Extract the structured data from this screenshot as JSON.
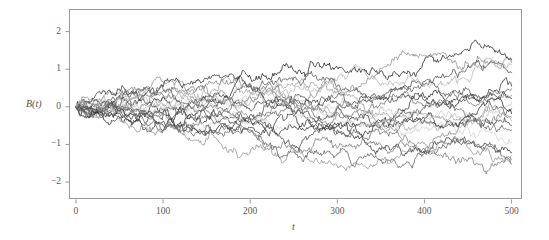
{
  "chart_data": {
    "type": "line",
    "title": "",
    "subtitle": "",
    "xlabel": "t",
    "ylabel": "B(t)",
    "xlim": [
      -8,
      512
    ],
    "ylim": [
      -2.45,
      2.6
    ],
    "xticks": [
      0,
      100,
      200,
      300,
      400,
      500
    ],
    "xtick_labels": [
      "0",
      "100",
      "200",
      "300",
      "400",
      "500"
    ],
    "yticks": [
      -2,
      -1,
      0,
      1,
      2
    ],
    "ytick_labels": [
      "−2",
      "−1",
      "0",
      "1",
      "2"
    ],
    "grid": false,
    "legend": false,
    "legend_position": "none",
    "frame": true,
    "n_paths": 20,
    "n_steps": 500,
    "start_value": 0,
    "path_colors": [
      "#1c1c1c",
      "#8a8a8a",
      "#4a4a4a",
      "#b4b4b4",
      "#2e2e2e",
      "#6e6e6e",
      "#9c9c9c",
      "#3a3a3a",
      "#c8c8c8",
      "#555555",
      "#272727",
      "#7d7d7d",
      "#a8a8a8",
      "#434343",
      "#626262",
      "#d2d2d2",
      "#333333",
      "#919191",
      "#5c5c5c",
      "#777777"
    ],
    "series": [
      {
        "name": "path-1",
        "color": "#1c1c1c",
        "end_value": 1.24,
        "seed": 11
      },
      {
        "name": "path-2",
        "color": "#8a8a8a",
        "end_value": 1.18,
        "seed": 23
      },
      {
        "name": "path-3",
        "color": "#4a4a4a",
        "end_value": 0.9,
        "seed": 37
      },
      {
        "name": "path-4",
        "color": "#b4b4b4",
        "end_value": 1.12,
        "seed": 41
      },
      {
        "name": "path-5",
        "color": "#2e2e2e",
        "end_value": 0.55,
        "seed": 53
      },
      {
        "name": "path-6",
        "color": "#6e6e6e",
        "end_value": 0.48,
        "seed": 67
      },
      {
        "name": "path-7",
        "color": "#9c9c9c",
        "end_value": 0.3,
        "seed": 71
      },
      {
        "name": "path-8",
        "color": "#3a3a3a",
        "end_value": 0.22,
        "seed": 83
      },
      {
        "name": "path-9",
        "color": "#c8c8c8",
        "end_value": 0.12,
        "seed": 97
      },
      {
        "name": "path-10",
        "color": "#555555",
        "end_value": -0.05,
        "seed": 101
      },
      {
        "name": "path-11",
        "color": "#272727",
        "end_value": -0.18,
        "seed": 113
      },
      {
        "name": "path-12",
        "color": "#7d7d7d",
        "end_value": -0.28,
        "seed": 127
      },
      {
        "name": "path-13",
        "color": "#a8a8a8",
        "end_value": -0.38,
        "seed": 139
      },
      {
        "name": "path-14",
        "color": "#434343",
        "end_value": -0.5,
        "seed": 149
      },
      {
        "name": "path-15",
        "color": "#626262",
        "end_value": -0.62,
        "seed": 163
      },
      {
        "name": "path-16",
        "color": "#d2d2d2",
        "end_value": -0.95,
        "seed": 173
      },
      {
        "name": "path-17",
        "color": "#333333",
        "end_value": -1.22,
        "seed": 181
      },
      {
        "name": "path-18",
        "color": "#919191",
        "end_value": -1.3,
        "seed": 193
      },
      {
        "name": "path-19",
        "color": "#5c5c5c",
        "end_value": -1.52,
        "seed": 199
      },
      {
        "name": "path-20",
        "color": "#777777",
        "end_value": -1.4,
        "seed": 211
      }
    ],
    "envelope_note": "Spread grows like sqrt(t); at t=500 paths span roughly -1.6 to +1.3."
  },
  "plot_area": {
    "left": 69,
    "top": 9,
    "right": 522,
    "bottom": 199,
    "frame_color": "#9a9a9a",
    "background": "#ffffff"
  },
  "axes": {
    "tick_color": "#9a9a9a",
    "label_color": "#5a5a5a",
    "tick_length": 4
  }
}
